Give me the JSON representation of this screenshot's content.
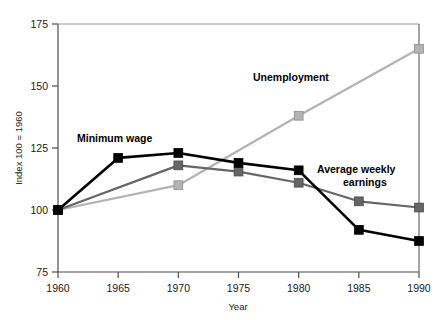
{
  "chart_data": {
    "type": "line",
    "title": "",
    "xlabel": "Year",
    "ylabel": "Index 100 = 1960",
    "x": [
      1960,
      1965,
      1970,
      1975,
      1980,
      1985,
      1990
    ],
    "xlim": [
      1960,
      1990
    ],
    "ylim": [
      75,
      175
    ],
    "xticks": [
      1960,
      1965,
      1970,
      1975,
      1980,
      1985,
      1990
    ],
    "yticks": [
      75,
      100,
      125,
      150,
      175
    ],
    "xtick_labels": [
      "1960",
      "1965",
      "1970",
      "1975",
      "1980",
      "1985",
      "1990"
    ],
    "ytick_labels": [
      "75",
      "100",
      "125",
      "150",
      "175"
    ],
    "grid": false,
    "legend_position": "inline-annotations",
    "series": [
      {
        "name": "Minimum wage",
        "color": "#000000",
        "marker": "square",
        "x": [
          1960,
          1965,
          1970,
          1975,
          1980,
          1985,
          1990
        ],
        "values": [
          100,
          121,
          123,
          119,
          116,
          92,
          87.5
        ]
      },
      {
        "name": "Average weekly earnings",
        "color": "#666666",
        "marker": "square",
        "x": [
          1960,
          1970,
          1975,
          1980,
          1985,
          1990
        ],
        "values": [
          100,
          118,
          115.5,
          111,
          103.5,
          101
        ]
      },
      {
        "name": "Unemployment",
        "color": "#b3b3b3",
        "marker": "square",
        "x": [
          1960,
          1970,
          1980,
          1990
        ],
        "values": [
          100,
          110,
          138,
          165
        ]
      }
    ],
    "annotations": [
      {
        "text": "Minimum wage",
        "x_px": 77,
        "y_px": 142
      },
      {
        "text": "Unemployment",
        "x_px": 253,
        "y_px": 81
      },
      {
        "text": "Average weekly",
        "x_px": 317,
        "y_px": 173
      },
      {
        "text": "earnings",
        "x_px": 343,
        "y_px": 186
      }
    ]
  },
  "axis": {
    "y_title": "Index 100 = 1960",
    "x_title": "Year"
  }
}
